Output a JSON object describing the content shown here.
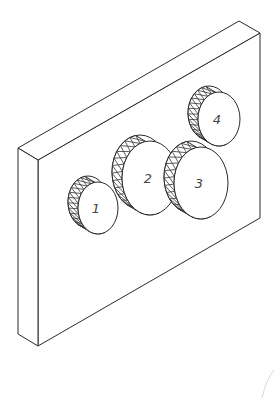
{
  "diagram": {
    "type": "isometric-technical-drawing",
    "colors": {
      "line": "#2a2a2a",
      "background": "#ffffff",
      "label": "#444444"
    },
    "plate": {
      "front_top_left": [
        38,
        160
      ],
      "front_top_right": [
        260,
        33
      ],
      "front_bottom_right": [
        260,
        218
      ],
      "front_bottom_left": [
        38,
        346
      ],
      "back_top_left": [
        18,
        148
      ],
      "back_top_right": [
        239,
        21
      ],
      "back_bottom_left": [
        18,
        334
      ]
    },
    "gears": [
      {
        "id": 1,
        "label": "1",
        "cx": 98,
        "cy": 208,
        "rx": 20,
        "ry": 26
      },
      {
        "id": 2,
        "label": "2",
        "cx": 150,
        "cy": 178,
        "rx": 28,
        "ry": 37
      },
      {
        "id": 3,
        "label": "3",
        "cx": 201,
        "cy": 183,
        "rx": 27,
        "ry": 36
      },
      {
        "id": 4,
        "label": "4",
        "cx": 219,
        "cy": 119,
        "rx": 21,
        "ry": 27
      }
    ]
  }
}
